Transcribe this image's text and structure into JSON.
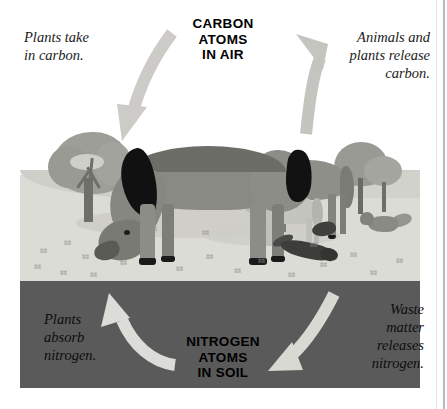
{
  "diagram": {
    "type": "carbon-nitrogen-cycle",
    "hubs": {
      "air": "CARBON\nATOMS\nIN AIR",
      "soil": "NITROGEN\nATOMS\nIN SOIL"
    },
    "labels": {
      "top_left": "Plants take\nin carbon.",
      "top_right": "Animals and\nplants release\ncarbon.",
      "bottom_left": "Plants\nabsorb\nnitrogen.",
      "bottom_right": "Waste\nmatter\nreleases\nnitrogen."
    },
    "arrows": [
      {
        "name": "carbon-to-plants",
        "from": "air",
        "to": "plants",
        "direction": "down-left"
      },
      {
        "name": "carbon-to-air",
        "from": "animals-plants",
        "to": "air",
        "direction": "up-left"
      },
      {
        "name": "nitrogen-to-plants",
        "from": "soil",
        "to": "plants",
        "direction": "up-left"
      },
      {
        "name": "waste-to-soil",
        "from": "waste",
        "to": "soil",
        "direction": "down-left"
      }
    ],
    "scene": {
      "description": "Grayscale illustration of grazing horses, a foal, a fox and small animals on a grassy plain above a cross-section of dark soil, with trees at left and right.",
      "animals": [
        "grazing-horse",
        "standing-horse",
        "foal",
        "fox",
        "otter",
        "bird"
      ],
      "plants": [
        "left-tree",
        "right-trees",
        "grass-tufts"
      ]
    },
    "colors": {
      "soil": "#5a5a5a",
      "ground": "#dcdcd7",
      "sky": "#ffffff",
      "arrow_light": "#c9c9c4",
      "arrow_pale": "#e2e2de",
      "text": "#1b1b1b"
    }
  }
}
